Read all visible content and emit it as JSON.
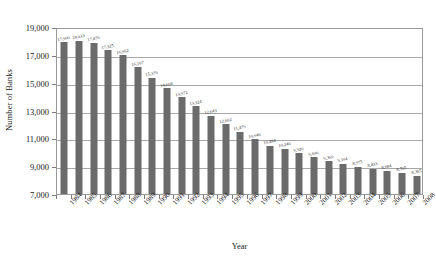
{
  "chart_data": {
    "type": "bar",
    "title": "",
    "xlabel": "Year",
    "ylabel": "Number of Banks",
    "categories": [
      "1984",
      "1985",
      "1986",
      "1987",
      "1988",
      "1989",
      "1990",
      "1991",
      "1992",
      "1993",
      "1994",
      "1995",
      "1996",
      "1997",
      "1998",
      "1999",
      "2000",
      "2001",
      "2002",
      "2003",
      "2004",
      "2005",
      "2006",
      "2007",
      "2008"
    ],
    "values": [
      17900,
      18033,
      17876,
      17325,
      16962,
      16107,
      15370,
      14608,
      13972,
      13324,
      12643,
      12002,
      11479,
      10946,
      10484,
      10240,
      9920,
      9630,
      9369,
      9194,
      8975,
      8833,
      8684,
      8535,
      8305
    ],
    "value_labels": [
      "17,900",
      "18,033",
      "17,876",
      "17,325",
      "16,962",
      "16,107",
      "15,370",
      "14,608",
      "13,972",
      "13,324",
      "12,643",
      "12,002",
      "11,479",
      "10,946",
      "10,484",
      "10,240",
      "9,920",
      "9,630",
      "9,369",
      "9,194",
      "8,975",
      "8,833",
      "8,684",
      "8,535",
      "8,305"
    ],
    "ylim": [
      7000,
      19000
    ],
    "ytick_values": [
      7000,
      9000,
      11000,
      13000,
      15000,
      17000,
      19000
    ],
    "ytick_labels": [
      "7,000",
      "9,000",
      "11,000",
      "13,000",
      "15,000",
      "17,000",
      "19,000"
    ],
    "grid": true,
    "legend": "none",
    "bar_color": "#6b6b6b",
    "axis_color": "#9a9a9a",
    "gridline_color": "#a8a8a8",
    "background_color": "#ffffff",
    "text_color": "#1a1a1a",
    "show_value_labels": true
  }
}
